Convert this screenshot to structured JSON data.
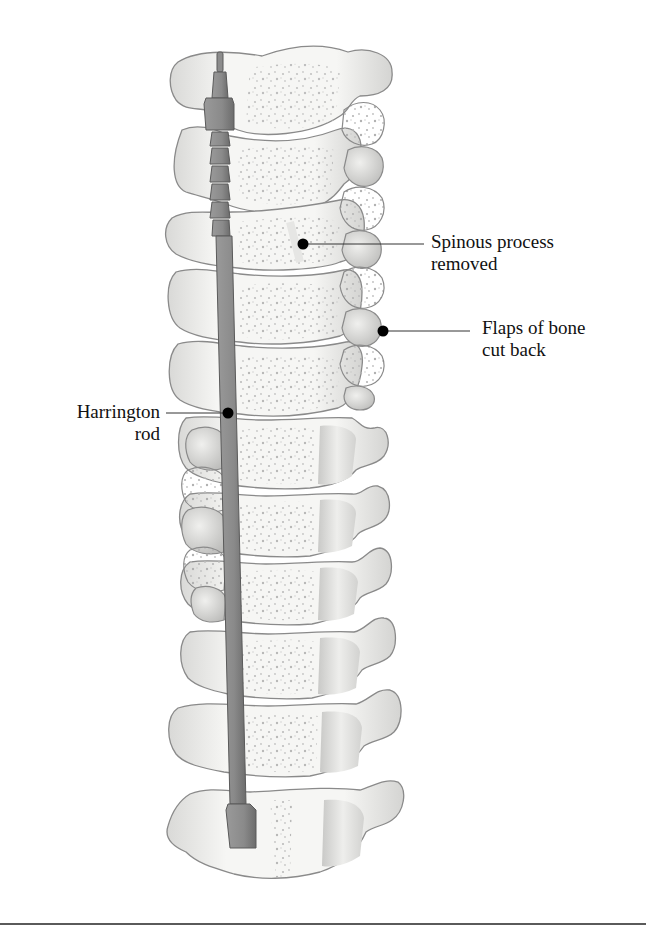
{
  "figure": {
    "type": "anatomical-illustration"
  },
  "labels": {
    "spinous_process": {
      "line1": "Spinous process",
      "line2": "removed"
    },
    "flaps_of_bone": {
      "line1": "Flaps of bone",
      "line2": "cut back"
    },
    "harrington_rod": {
      "line1": "Harrington",
      "line2": "rod"
    }
  },
  "colors": {
    "bone_fill": "#f4f4f2",
    "bone_outline": "#8a8a8a",
    "bone_speckle": "#b9b9b9",
    "rod_fill": "#8c8c8c",
    "rod_dark": "#6e6e6e",
    "leader_line": "#333333",
    "marker_dot": "#000000"
  }
}
